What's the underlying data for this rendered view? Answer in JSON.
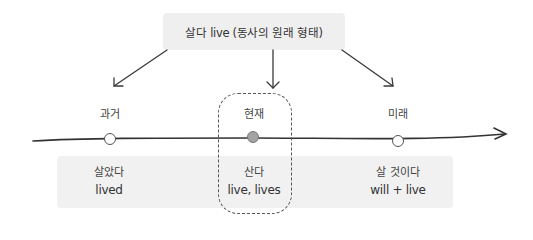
{
  "root": {
    "label": "살다 live (동사의 원래 형태)"
  },
  "timeline": {
    "points": [
      {
        "key": "past",
        "label": "과거",
        "form_ko": "살았다",
        "form_en": "lived",
        "marker": "open-circle"
      },
      {
        "key": "present",
        "label": "현재",
        "form_ko": "산다",
        "form_en": "live, lives",
        "marker": "filled-circle",
        "highlighted": true
      },
      {
        "key": "future",
        "label": "미래",
        "form_ko": "살 것이다",
        "form_en": "will + live",
        "marker": "open-circle"
      }
    ]
  },
  "colors": {
    "box_fill": "#efefef",
    "band_fill": "#f1f1f1",
    "line": "#333333",
    "present_marker": "#a3a3a3",
    "open_marker_fill": "#ffffff"
  }
}
